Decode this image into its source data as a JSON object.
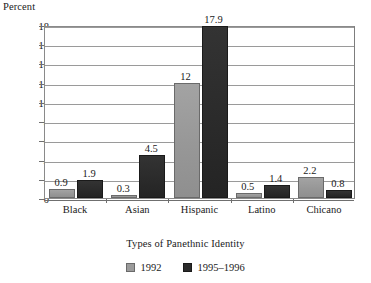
{
  "chart_data": {
    "type": "bar",
    "title": "",
    "xlabel": "Types of Panethnic Identity",
    "ylabel": "Percent",
    "categories": [
      "Black",
      "Asian",
      "Hispanic",
      "Latino",
      "Chicano"
    ],
    "series": [
      {
        "name": "1992",
        "color": "#9b9b9b",
        "values": [
          0.9,
          0.3,
          12,
          0.5,
          2.2
        ],
        "labels": [
          "0.9",
          "0.3",
          "12",
          "0.5",
          "2.2"
        ]
      },
      {
        "name": "1995–1996",
        "color": "#2b2b2b",
        "values": [
          1.9,
          4.5,
          17.9,
          1.4,
          0.8
        ],
        "labels": [
          "1.9",
          "4.5",
          "17.9",
          "1.4",
          "0.8"
        ]
      }
    ],
    "ylim": [
      0,
      18
    ],
    "yticks": [
      0,
      2,
      4,
      6,
      8,
      10,
      12,
      14,
      16,
      18
    ],
    "ytick_labels": [
      "0",
      "2",
      "4",
      "6",
      "8",
      "10",
      "12",
      "14",
      "16",
      "18"
    ],
    "grid": "horizontal",
    "legend_position": "bottom-center"
  },
  "legend": {
    "entries": [
      {
        "label": "1992"
      },
      {
        "label": "1995–1996"
      }
    ]
  }
}
